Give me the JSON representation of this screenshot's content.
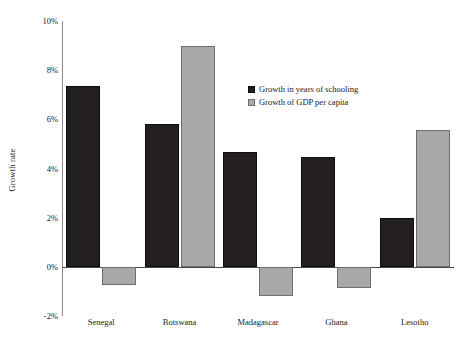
{
  "chart_data": {
    "type": "bar",
    "title": "",
    "xlabel": "",
    "ylabel": "Growth rate",
    "ylim": [
      -2,
      10
    ],
    "yticks": [
      10,
      8,
      6,
      4,
      2,
      0,
      -2
    ],
    "ytick_labels": [
      "10%",
      "8%",
      "6%",
      "4%",
      "2%",
      "0%",
      "-2%"
    ],
    "grid": false,
    "legend_position": "inside-upper-center",
    "categories": [
      "Senegal",
      "Botswana",
      "Madagascar",
      "Ghana",
      "Lesotho"
    ],
    "series": [
      {
        "name": "Growth in years of schooling",
        "color": "#231f20",
        "values": [
          7.35,
          5.8,
          4.67,
          4.47,
          2.0
        ]
      },
      {
        "name": "Growth of GDP per capita",
        "color": "#a9a9a9",
        "values": [
          -0.73,
          8.98,
          -1.18,
          -0.85,
          5.57
        ]
      }
    ]
  },
  "legend": {
    "items": [
      {
        "label": "Growth in years of schooling",
        "swatch": "dark"
      },
      {
        "label": "Growth of GDP per capita",
        "swatch": "light"
      }
    ]
  },
  "axis": {
    "y_title": "Growth rate",
    "y_tick_labels": [
      "10%",
      "8%",
      "6%",
      "4%",
      "2%",
      "0%",
      "-2%"
    ],
    "x_tick_labels": [
      "Senegal",
      "Botswana",
      "Madagascar",
      "Ghana",
      "Lesotho"
    ]
  }
}
